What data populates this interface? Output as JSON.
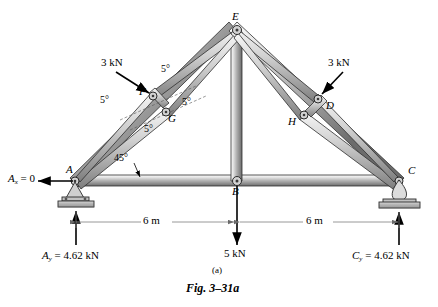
{
  "figure": {
    "caption": "Fig. 3–31a",
    "part_label": "(a)"
  },
  "joints": [
    {
      "id": "A",
      "label": "A",
      "x": 75,
      "y": 181
    },
    {
      "id": "B",
      "label": "B",
      "x": 237,
      "y": 181
    },
    {
      "id": "C",
      "label": "C",
      "x": 399,
      "y": 181
    },
    {
      "id": "E",
      "label": "E",
      "x": 237,
      "y": 29
    },
    {
      "id": "F",
      "label": "F",
      "x": 153,
      "y": 96
    },
    {
      "id": "G",
      "label": "G",
      "x": 166,
      "y": 112
    },
    {
      "id": "D",
      "label": "D",
      "x": 318,
      "y": 99
    },
    {
      "id": "H",
      "label": "H",
      "x": 304,
      "y": 115
    }
  ],
  "angles": [
    {
      "id": "a45",
      "text": "45°",
      "x": 122,
      "y": 160
    },
    {
      "id": "a5_top",
      "text": "5°",
      "x": 163,
      "y": 71
    },
    {
      "id": "a5_left",
      "text": "5°",
      "x": 106,
      "y": 101
    },
    {
      "id": "a5_right",
      "text": "5°",
      "x": 185,
      "y": 104
    },
    {
      "id": "a5_bottom",
      "text": "5°",
      "x": 148,
      "y": 130
    }
  ],
  "loads": [
    {
      "id": "load-left",
      "text": "3 kN",
      "x": 108,
      "y": 64
    },
    {
      "id": "load-right",
      "text": "3 kN",
      "x": 333,
      "y": 64
    },
    {
      "id": "load-center",
      "text": "5 kN",
      "x": 228,
      "y": 252
    }
  ],
  "reactions": {
    "ax": {
      "symbol": "A",
      "subscript": "x",
      "value": "= 0",
      "x": 10,
      "y": 176
    },
    "ay": {
      "symbol": "A",
      "subscript": "y",
      "value": "= 4.62 kN",
      "x": 48,
      "y": 254
    },
    "cy": {
      "symbol": "C",
      "subscript": "y",
      "value": "= 4.62 kN",
      "x": 358,
      "y": 254
    }
  },
  "dimensions": [
    {
      "id": "dim-left",
      "text": "6 m",
      "x": 148,
      "y": 217
    },
    {
      "id": "dim-right",
      "text": "6 m",
      "x": 310,
      "y": 217
    }
  ],
  "colors": {
    "member_light": "#f2f2f2",
    "member_mid": "#b9b9b9",
    "member_dark": "#6a6a6a",
    "outline": "#2b2b2b",
    "base_plate": "#b0b0b0",
    "dim_line": "#8d8d8d"
  }
}
